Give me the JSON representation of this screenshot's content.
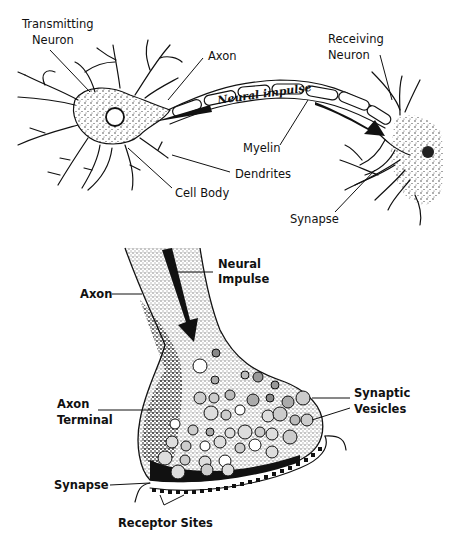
{
  "diagram": {
    "top_panel": {
      "title": "Neuron to neuron signal transmission",
      "labels": {
        "transmitting_neuron_1": "Transmitting",
        "transmitting_neuron_2": "Neuron",
        "axon": "Axon",
        "neural_impulse": "Neural impulse",
        "receiving_neuron_1": "Receiving",
        "receiving_neuron_2": "Neuron",
        "myelin": "Myelin",
        "dendrites": "Dendrites",
        "cell_body": "Cell Body",
        "synapse": "Synapse"
      }
    },
    "bottom_panel": {
      "title": "Axon terminal detail",
      "labels": {
        "neural_impulse_1": "Neural",
        "neural_impulse_2": "Impulse",
        "axon": "Axon",
        "axon_terminal_1": "Axon",
        "axon_terminal_2": "Terminal",
        "synaptic_vesicles_1": "Synaptic",
        "synaptic_vesicles_2": "Vesicles",
        "synapse": "Synapse",
        "receptor_sites": "Receptor Sites"
      }
    },
    "colors": {
      "ink": "#111111",
      "background": "#ffffff"
    }
  }
}
